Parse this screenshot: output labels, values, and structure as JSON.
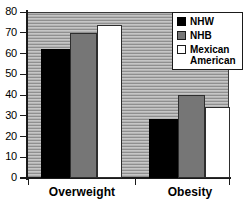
{
  "chart_data": {
    "type": "bar",
    "title": "",
    "xlabel": "",
    "ylabel": "",
    "categories": [
      "Overweight",
      "Obesity"
    ],
    "series": [
      {
        "name": "NHW",
        "color": "#000000",
        "values": [
          62,
          28.5
        ]
      },
      {
        "name": "NHB",
        "color": "#767676",
        "values": [
          70,
          40
        ]
      },
      {
        "name": "Mexican American",
        "color": "#ffffff",
        "values": [
          73.5,
          34
        ]
      }
    ],
    "ylim": [
      0,
      80
    ],
    "ytick_step": 10,
    "yticks": [
      "80",
      "70",
      "60",
      "50",
      "40",
      "30",
      "20",
      "10",
      "0"
    ],
    "grid": false,
    "plot_background": "hatched-horizontal-gray",
    "legend_position": "top-right"
  },
  "legend": {
    "entries": [
      {
        "label": "NHW",
        "swatch": "black-swatch-icon"
      },
      {
        "label": "NHB",
        "swatch": "gray-swatch-icon"
      },
      {
        "label": "Mexican\nAmerican",
        "swatch": "white-swatch-icon"
      }
    ]
  },
  "axis": {
    "y_labels": [
      "80",
      "70",
      "60",
      "50",
      "40",
      "30",
      "20",
      "10",
      "0"
    ],
    "x_labels": [
      "Overweight",
      "Obesity"
    ]
  }
}
